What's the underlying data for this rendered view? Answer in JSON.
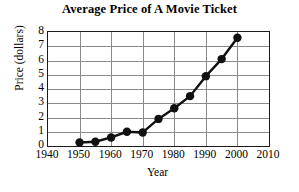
{
  "chart_data": {
    "type": "line",
    "title": "Average Price of A Movie Ticket",
    "xlabel": "Year",
    "ylabel": "Price (dollars)",
    "xlim": [
      1940,
      2010
    ],
    "ylim": [
      0,
      8
    ],
    "grid": true,
    "legend": null,
    "x": [
      1950,
      1955,
      1960,
      1965,
      1970,
      1975,
      1980,
      1985,
      1990,
      1995,
      2000
    ],
    "values": [
      0.25,
      0.3,
      0.6,
      1.0,
      0.95,
      1.9,
      2.65,
      3.5,
      4.9,
      6.1,
      7.6
    ],
    "xticks": [
      1940,
      1950,
      1960,
      1970,
      1980,
      1990,
      2000,
      2010
    ],
    "xtick_labels": [
      "1940",
      "1950",
      "1960",
      "1970",
      "1980",
      "1990",
      "2000",
      "2010"
    ],
    "yticks": [
      0,
      1,
      2,
      3,
      4,
      5,
      6,
      7,
      8
    ],
    "ytick_labels": [
      "0",
      "1",
      "2",
      "3",
      "4",
      "5",
      "6",
      "7",
      "8"
    ],
    "series_color": "#111111",
    "grid_color": "#8a8a8a",
    "axis_color": "#1a1a1a",
    "marker": "circle",
    "marker_size": 4.2,
    "line_width": 2.4
  }
}
